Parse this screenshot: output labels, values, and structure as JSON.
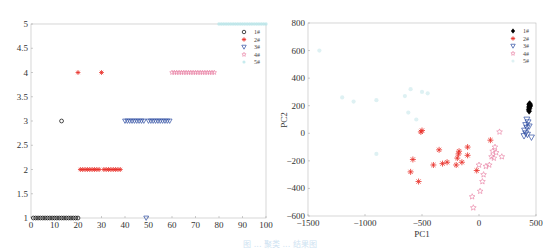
{
  "caption": "图 ... 聚类 ... 结果图",
  "chart_data": [
    {
      "type": "scatter",
      "title": "",
      "xlabel": "",
      "ylabel": "",
      "xlim": [
        0,
        100
      ],
      "ylim": [
        1,
        5
      ],
      "xticks": [
        "0",
        "10",
        "20",
        "30",
        "40",
        "50",
        "60",
        "70",
        "80",
        "90",
        "100"
      ],
      "yticks": [
        "1",
        "1.5",
        "2",
        "2.5",
        "3",
        "3.5",
        "4",
        "4.5",
        "5"
      ],
      "grid": false,
      "legend_position": "top-right",
      "legend": [
        "1#",
        "2#",
        "3#",
        "4#",
        "5#"
      ],
      "series": [
        {
          "name": "1#",
          "marker": "circle",
          "color": "#000000",
          "points": [
            [
              1,
              1
            ],
            [
              2,
              1
            ],
            [
              3,
              1
            ],
            [
              4,
              1
            ],
            [
              5,
              1
            ],
            [
              6,
              1
            ],
            [
              7,
              1
            ],
            [
              8,
              1
            ],
            [
              9,
              1
            ],
            [
              10,
              1
            ],
            [
              11,
              1
            ],
            [
              12,
              1
            ],
            [
              13,
              1
            ],
            [
              14,
              1
            ],
            [
              15,
              1
            ],
            [
              16,
              1
            ],
            [
              17,
              1
            ],
            [
              18,
              1
            ],
            [
              19,
              1
            ],
            [
              20,
              1
            ],
            [
              13,
              3
            ]
          ]
        },
        {
          "name": "2#",
          "marker": "star",
          "color": "#e8302a",
          "points": [
            [
              20,
              4
            ],
            [
              30,
              4
            ],
            [
              21,
              2
            ],
            [
              22,
              2
            ],
            [
              23,
              2
            ],
            [
              24,
              2
            ],
            [
              25,
              2
            ],
            [
              26,
              2
            ],
            [
              27,
              2
            ],
            [
              28,
              2
            ],
            [
              29,
              2
            ],
            [
              31,
              2
            ],
            [
              32,
              2
            ],
            [
              33,
              2
            ],
            [
              34,
              2
            ],
            [
              35,
              2
            ],
            [
              36,
              2
            ],
            [
              37,
              2
            ],
            [
              38,
              2
            ]
          ]
        },
        {
          "name": "3#",
          "marker": "triangle-down",
          "color": "#2b4aa0",
          "points": [
            [
              40,
              3
            ],
            [
              41,
              3
            ],
            [
              42,
              3
            ],
            [
              43,
              3
            ],
            [
              44,
              3
            ],
            [
              45,
              3
            ],
            [
              46,
              3
            ],
            [
              47,
              3
            ],
            [
              48,
              3
            ],
            [
              50,
              3
            ],
            [
              51,
              3
            ],
            [
              52,
              3
            ],
            [
              53,
              3
            ],
            [
              54,
              3
            ],
            [
              55,
              3
            ],
            [
              56,
              3
            ],
            [
              57,
              3
            ],
            [
              58,
              3
            ],
            [
              59,
              3
            ],
            [
              49,
              1
            ]
          ]
        },
        {
          "name": "4#",
          "marker": "pentagram",
          "color": "#e87aa0",
          "points": [
            [
              60,
              4
            ],
            [
              61,
              4
            ],
            [
              62,
              4
            ],
            [
              63,
              4
            ],
            [
              64,
              4
            ],
            [
              65,
              4
            ],
            [
              66,
              4
            ],
            [
              67,
              4
            ],
            [
              68,
              4
            ],
            [
              69,
              4
            ],
            [
              70,
              4
            ],
            [
              71,
              4
            ],
            [
              72,
              4
            ],
            [
              73,
              4
            ],
            [
              74,
              4
            ],
            [
              75,
              4
            ],
            [
              76,
              4
            ],
            [
              77,
              4
            ],
            [
              78,
              4
            ]
          ]
        },
        {
          "name": "5#",
          "marker": "dot",
          "color": "#b9e6ea",
          "points": [
            [
              80,
              5
            ],
            [
              81,
              5
            ],
            [
              82,
              5
            ],
            [
              83,
              5
            ],
            [
              84,
              5
            ],
            [
              85,
              5
            ],
            [
              86,
              5
            ],
            [
              87,
              5
            ],
            [
              88,
              5
            ],
            [
              89,
              5
            ],
            [
              90,
              5
            ],
            [
              91,
              5
            ],
            [
              92,
              5
            ],
            [
              93,
              5
            ],
            [
              94,
              5
            ],
            [
              95,
              5
            ],
            [
              96,
              5
            ],
            [
              97,
              5
            ],
            [
              98,
              5
            ],
            [
              99,
              5
            ],
            [
              100,
              5
            ]
          ]
        }
      ]
    },
    {
      "type": "scatter",
      "title": "",
      "xlabel": "PC1",
      "ylabel": "PC2",
      "xlim": [
        -1500,
        500
      ],
      "ylim": [
        -600,
        800
      ],
      "xticks": [
        "−1500",
        "−1000",
        "−500",
        "0",
        "500"
      ],
      "yticks": [
        "−600",
        "−400",
        "−200",
        "0",
        "200",
        "400",
        "600",
        "800"
      ],
      "grid": false,
      "legend_position": "top-right",
      "legend": [
        "1#",
        "2#",
        "3#",
        "4#",
        "5#"
      ],
      "series": [
        {
          "name": "1#",
          "marker": "diamond",
          "color": "#000000",
          "points": [
            [
              440,
              210
            ],
            [
              445,
              200
            ],
            [
              438,
              190
            ],
            [
              442,
              180
            ],
            [
              436,
              170
            ],
            [
              440,
              160
            ],
            [
              445,
              215
            ],
            [
              450,
              205
            ],
            [
              448,
              195
            ]
          ]
        },
        {
          "name": "2#",
          "marker": "star",
          "color": "#e8302a",
          "points": [
            [
              -510,
              10
            ],
            [
              -500,
              20
            ],
            [
              -580,
              -190
            ],
            [
              -600,
              -280
            ],
            [
              -530,
              -350
            ],
            [
              -400,
              -230
            ],
            [
              -350,
              -120
            ],
            [
              -320,
              -220
            ],
            [
              -280,
              -210
            ],
            [
              -200,
              -230
            ],
            [
              -190,
              -180
            ],
            [
              -180,
              -150
            ],
            [
              -175,
              -130
            ],
            [
              -150,
              -210
            ],
            [
              -100,
              -100
            ],
            [
              -100,
              -160
            ],
            [
              -20,
              -270
            ],
            [
              100,
              -50
            ]
          ]
        },
        {
          "name": "3#",
          "marker": "triangle-down",
          "color": "#2b4aa0",
          "points": [
            [
              420,
              100
            ],
            [
              410,
              60
            ],
            [
              420,
              40
            ],
            [
              430,
              80
            ],
            [
              400,
              20
            ],
            [
              395,
              -20
            ],
            [
              410,
              0
            ],
            [
              460,
              -30
            ],
            [
              425,
              -10
            ],
            [
              440,
              50
            ]
          ]
        },
        {
          "name": "4#",
          "marker": "pentagram",
          "color": "#e87aa0",
          "points": [
            [
              180,
              10
            ],
            [
              140,
              -100
            ],
            [
              120,
              -130
            ],
            [
              110,
              -170
            ],
            [
              130,
              -180
            ],
            [
              200,
              -170
            ],
            [
              90,
              -230
            ],
            [
              60,
              -240
            ],
            [
              40,
              -300
            ],
            [
              30,
              -350
            ],
            [
              10,
              -420
            ],
            [
              -60,
              -460
            ],
            [
              -50,
              -540
            ],
            [
              0,
              -230
            ],
            [
              150,
              -140
            ]
          ]
        },
        {
          "name": "5#",
          "marker": "dot",
          "color": "#d6eef0",
          "points": [
            [
              -1200,
              260
            ],
            [
              -1100,
              230
            ],
            [
              -900,
              240
            ],
            [
              -650,
              270
            ],
            [
              -600,
              320
            ],
            [
              -500,
              300
            ],
            [
              -450,
              290
            ],
            [
              -620,
              150
            ],
            [
              -550,
              100
            ],
            [
              -900,
              -150
            ],
            [
              -1400,
              600
            ]
          ]
        }
      ]
    }
  ]
}
